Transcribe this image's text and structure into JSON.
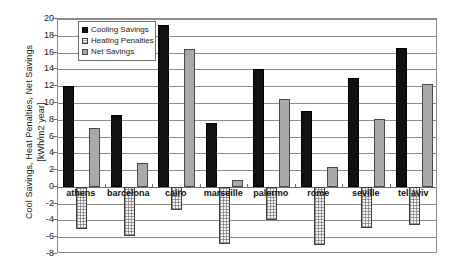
{
  "chart_data": {
    "type": "bar",
    "title": "",
    "xlabel": "",
    "ylabel": "Cool Savings, Heat Penalties, Net Savings\n[kWh/m2 year]",
    "ylim": [
      -8,
      20
    ],
    "ytick_step": 2,
    "yticks": [
      20,
      18,
      16,
      14,
      12,
      10,
      8,
      6,
      4,
      2,
      0,
      -2,
      -4,
      -6,
      -8
    ],
    "ytick_labels": [
      "20",
      "18",
      "16",
      "14",
      "12",
      "10",
      "8",
      "6",
      "4",
      "2",
      "0",
      "-2",
      "-4",
      "-6",
      "-8"
    ],
    "grid": true,
    "legend_position": "upper-left-inside",
    "categories": [
      "athens",
      "barcelona",
      "cairo",
      "marseille",
      "palermo",
      "rome",
      "seville",
      "tel aviv"
    ],
    "series": [
      {
        "name": "Cooling Savings",
        "color": "#111111",
        "values": [
          12.0,
          8.6,
          19.3,
          7.6,
          14.0,
          9.0,
          13.0,
          16.5
        ]
      },
      {
        "name": "Heating Penalties",
        "color": "#f4f4f4",
        "values": [
          -5.0,
          -5.8,
          -2.8,
          -6.8,
          -4.0,
          -6.9,
          -4.9,
          -4.5
        ]
      },
      {
        "name": "Net Savings",
        "color": "#a9a9a9",
        "values": [
          7.0,
          2.9,
          16.4,
          0.8,
          10.5,
          2.4,
          8.1,
          12.2
        ]
      }
    ]
  },
  "legend": {
    "items": [
      {
        "label": "Cooling Savings",
        "swatch": "cooling"
      },
      {
        "label": "Heating Penalties",
        "swatch": "heating"
      },
      {
        "label": "Net Savings",
        "swatch": "net"
      }
    ]
  }
}
